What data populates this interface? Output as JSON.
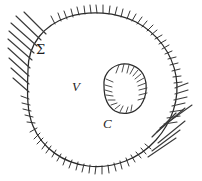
{
  "figure": {
    "background_color": "#ffffff",
    "ink_color": "#2b2b2b",
    "style": "hand-drawn line diagram",
    "labels": {
      "outer_surface": "Σ",
      "volume": "V",
      "inner_surface": "C"
    },
    "regions": [
      {
        "name": "outer-boundary",
        "label": "Σ",
        "description": "closed irregular outer curve with exterior hatching",
        "hatching_side": "outside"
      },
      {
        "name": "volume-interior",
        "label": "V",
        "description": "unhatched interior region between outer curve and inner cavity",
        "hatching_side": "none"
      },
      {
        "name": "inner-cavity-boundary",
        "label": "C",
        "description": "small closed curve forming a cavity, hatched toward its interior",
        "hatching_side": "inside"
      }
    ]
  }
}
